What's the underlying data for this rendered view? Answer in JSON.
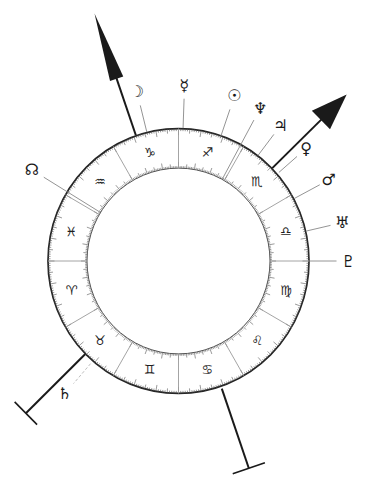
{
  "wheel": {
    "center": {
      "x": 178.5,
      "y": 261
    },
    "y_scale": 1.015,
    "outer_radius": 130.5,
    "inner_radius": 91.5,
    "sign_glyph_radius": 111,
    "colors": {
      "background": "#ffffff",
      "ring_outer": "#222222",
      "ring_inner": "#555555",
      "ticks": "#555555",
      "boundary": "#9a9a9a",
      "planet_line": "#888888",
      "axis": "#1a1a1a",
      "glyph": "#1a1a1a"
    },
    "ticks": {
      "outer": {
        "deg1": 2.5,
        "deg5": 4.5,
        "deg10": 6.5
      },
      "inner": {
        "deg1": 2,
        "deg5": 4,
        "deg10": 6
      }
    },
    "sign_boundaries_deg": [
      0,
      30,
      60,
      90,
      120,
      150,
      180,
      210,
      240,
      270,
      300,
      330
    ],
    "zodiac_signs": [
      {
        "name": "libra",
        "glyph": "♎",
        "angle": 15
      },
      {
        "name": "scorpio",
        "glyph": "♏",
        "angle": 45
      },
      {
        "name": "sagittarius",
        "glyph": "♐",
        "angle": 75
      },
      {
        "name": "capricorn",
        "glyph": "♑",
        "angle": 105
      },
      {
        "name": "aquarius",
        "glyph": "♒",
        "angle": 135
      },
      {
        "name": "pisces",
        "glyph": "♓",
        "angle": 165
      },
      {
        "name": "aries",
        "glyph": "♈",
        "angle": 195
      },
      {
        "name": "taurus",
        "glyph": "♉",
        "angle": 225
      },
      {
        "name": "gemini",
        "glyph": "♊",
        "angle": 255
      },
      {
        "name": "cancer",
        "glyph": "♋",
        "angle": 285
      },
      {
        "name": "leo",
        "glyph": "♌",
        "angle": 315
      },
      {
        "name": "virgo",
        "glyph": "♍",
        "angle": 345
      }
    ],
    "planets": [
      {
        "name": "moon",
        "glyph": "☽",
        "angle": 104,
        "line_from": 131,
        "line_to": 158,
        "glyph_r": 172,
        "dashed": false
      },
      {
        "name": "mercury",
        "glyph": "☿",
        "angle": 88,
        "line_from": 131,
        "line_to": 160,
        "glyph_r": 173,
        "dashed": false
      },
      {
        "name": "sun",
        "glyph": "☉",
        "angle": 71,
        "line_from": 128,
        "line_to": 158,
        "glyph_r": 172,
        "dashed": false
      },
      {
        "name": "neptune",
        "glyph": "♆",
        "angle": 61.5,
        "line_from": 92,
        "line_to": 158,
        "glyph_r": 171,
        "dashed": false
      },
      {
        "name": "jupiter",
        "glyph": "♃",
        "angle": 52.6,
        "line_from": 131,
        "line_to": 157,
        "glyph_r": 168,
        "dashed": false
      },
      {
        "name": "venus",
        "glyph": "♀",
        "angle": 41,
        "line_from": 133,
        "line_to": 157,
        "glyph_r": 169,
        "dashed": false
      },
      {
        "name": "mars",
        "glyph": "♂",
        "angle": 28,
        "line_from": 131,
        "line_to": 160,
        "glyph_r": 170,
        "dashed": false
      },
      {
        "name": "uranus",
        "glyph": "♅",
        "angle": 13,
        "line_from": 131,
        "line_to": 156,
        "glyph_r": 168,
        "dashed": false
      },
      {
        "name": "pluto",
        "glyph": "♇",
        "angle": 0,
        "line_from": 130,
        "line_to": 158,
        "glyph_r": 170,
        "dashed": false
      },
      {
        "name": "north-node",
        "glyph": "☊",
        "angle": 148.5,
        "line_from": 92,
        "line_to": 158,
        "glyph_r": 172,
        "dashed": false
      },
      {
        "name": "saturn",
        "glyph": "♄",
        "angle": 229,
        "line_from": 134,
        "line_to": 160,
        "glyph_r": 173,
        "dashed": true
      }
    ],
    "axes": [
      {
        "name": "midheaven-arrow",
        "angle": 109,
        "line_from": 131,
        "line_to": 194,
        "end": "arrow",
        "head_base_r": 190,
        "head_tip_r": 258,
        "head_half_width": 7
      },
      {
        "name": "ascendant-arrow",
        "angle": 44.3,
        "line_from": 131,
        "line_to": 203,
        "end": "arrow",
        "head_base_r": 199,
        "head_tip_r": 235,
        "head_half_width": 13
      },
      {
        "name": "descendant-axis",
        "angle": 224.5,
        "line_from": 131,
        "line_to": 214,
        "end": "bar",
        "bar_half_length": 16
      },
      {
        "name": "imum-coeli-axis",
        "angle": 289,
        "line_from": 133,
        "line_to": 216,
        "end": "bar",
        "bar_half_length": 17
      }
    ]
  }
}
